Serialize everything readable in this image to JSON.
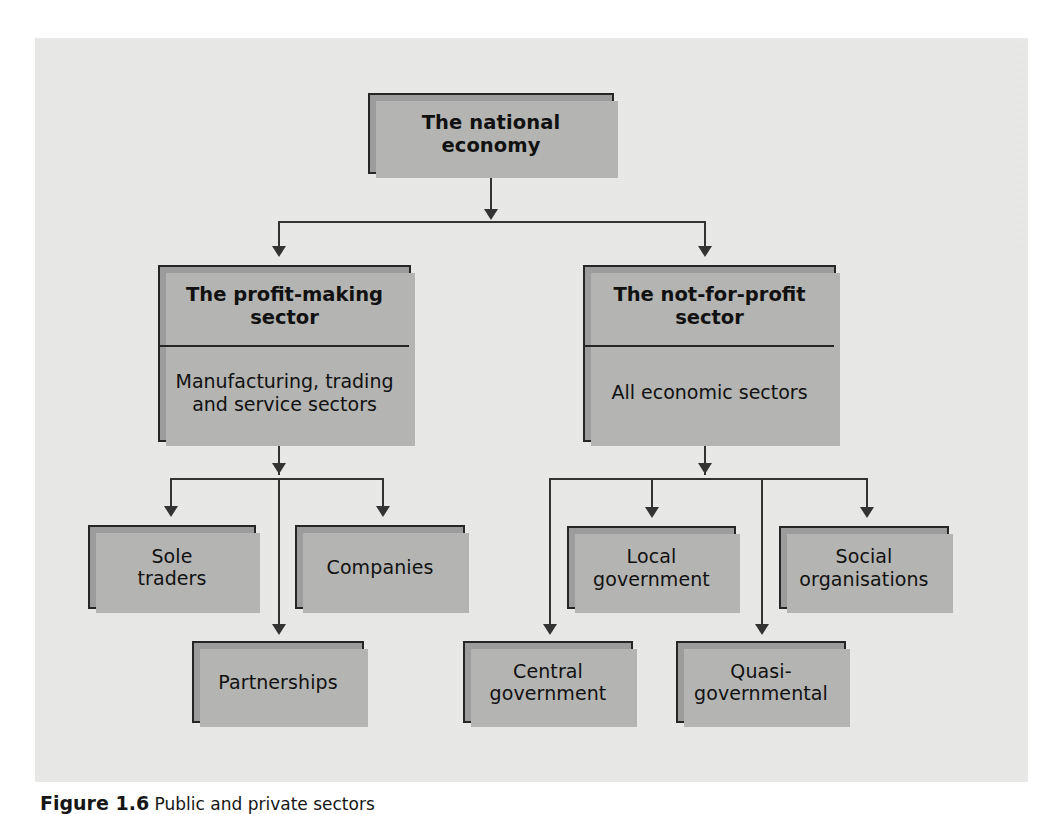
{
  "figure": {
    "caption_label": "Figure 1.6",
    "caption_text": "Public and private sectors",
    "panel_color": "#e9e9e7",
    "box_fill_color": "#9c9c9c",
    "box_border_color": "#262626",
    "connector_color": "#333333"
  },
  "diagram": {
    "type": "hierarchy-tree",
    "root": {
      "label": "The national economy"
    },
    "level2": [
      {
        "id": "profit-making",
        "header": "The profit-making\nsector",
        "body": "Manufacturing, trading\nand service sectors"
      },
      {
        "id": "not-for-profit",
        "header": "The not-for-profit\nsector",
        "body": "All economic sectors"
      }
    ],
    "level3": [
      {
        "id": "sole-traders",
        "label": "Sole\ntraders",
        "parent": "profit-making"
      },
      {
        "id": "companies",
        "label": "Companies",
        "parent": "profit-making"
      },
      {
        "id": "partnerships",
        "label": "Partnerships",
        "parent": "profit-making"
      },
      {
        "id": "local-government",
        "label": "Local\ngovernment",
        "parent": "not-for-profit"
      },
      {
        "id": "social-organisations",
        "label": "Social\norganisations",
        "parent": "not-for-profit"
      },
      {
        "id": "central-government",
        "label": "Central\ngovernment",
        "parent": "not-for-profit"
      },
      {
        "id": "quasi-governmental",
        "label": "Quasi-\ngovernmental",
        "parent": "not-for-profit"
      }
    ]
  }
}
